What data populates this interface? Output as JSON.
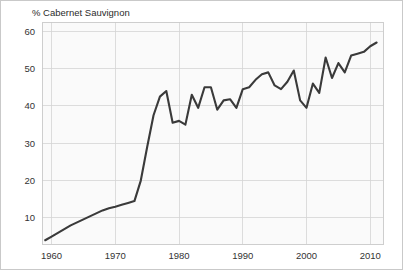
{
  "figure": {
    "title": "% Cabernet Sauvignon",
    "background_color": "#ffffff",
    "plot_background_color": "#fafafa",
    "border_color": "#c9c9c9",
    "grid_color": "#d4d4d4",
    "line_color": "#3a3a3a"
  },
  "chart_data": {
    "type": "line",
    "title": "% Cabernet Sauvignon",
    "xlabel": "",
    "ylabel": "",
    "xlim": [
      1958.5,
      2012.0
    ],
    "ylim": [
      3.0,
      62.5
    ],
    "grid": true,
    "legend": false,
    "xticks": [
      1960,
      1970,
      1980,
      1990,
      2000,
      2010
    ],
    "yticks": [
      10,
      20,
      30,
      40,
      50,
      60
    ],
    "xtick_labels": [
      "1960",
      "1970",
      "1980",
      "1990",
      "2000",
      "2010"
    ],
    "ytick_labels": [
      "10",
      "20",
      "30",
      "40",
      "50",
      "60"
    ],
    "series": [
      {
        "name": "% Cabernet Sauvignon",
        "x": [
          1959,
          1960,
          1961,
          1962,
          1963,
          1964,
          1965,
          1966,
          1967,
          1968,
          1969,
          1970,
          1971,
          1972,
          1973,
          1974,
          1975,
          1976,
          1977,
          1978,
          1979,
          1980,
          1981,
          1982,
          1983,
          1984,
          1985,
          1986,
          1987,
          1988,
          1989,
          1990,
          1991,
          1992,
          1993,
          1994,
          1995,
          1996,
          1997,
          1998,
          1999,
          2000,
          2001,
          2002,
          2003,
          2004,
          2005,
          2006,
          2007,
          2008,
          2009,
          2010,
          2011
        ],
        "values": [
          4.0,
          5.0,
          6.0,
          7.0,
          8.0,
          8.8,
          9.6,
          10.4,
          11.2,
          12.0,
          12.6,
          13.0,
          13.5,
          14.0,
          14.5,
          20.0,
          29.0,
          37.5,
          42.5,
          44.0,
          35.5,
          36.0,
          35.0,
          43.0,
          39.5,
          45.0,
          45.0,
          39.0,
          41.5,
          41.8,
          39.5,
          44.5,
          45.0,
          47.0,
          48.5,
          49.0,
          45.5,
          44.5,
          46.5,
          49.5,
          41.5,
          39.5,
          46.0,
          43.5,
          53.0,
          47.5,
          51.5,
          49.0,
          53.5,
          54.0,
          54.5,
          56.0,
          57.0
        ]
      }
    ]
  },
  "axes": {
    "x_tick_labels": [
      "1960",
      "1970",
      "1980",
      "1990",
      "2000",
      "2010"
    ],
    "y_tick_labels": [
      "10",
      "20",
      "30",
      "40",
      "50",
      "60"
    ]
  }
}
